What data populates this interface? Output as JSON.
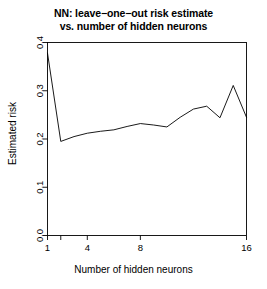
{
  "chart_data": {
    "type": "line",
    "title_line1": "NN: leave−one−out risk estimate",
    "title_line2": "vs. number of hidden neurons",
    "xlabel": "Number of hidden neurons",
    "ylabel": "Estimated risk",
    "x": [
      1,
      2,
      3,
      4,
      5,
      6,
      7,
      8,
      9,
      10,
      11,
      12,
      13,
      14,
      15,
      16
    ],
    "values": [
      0.378,
      0.195,
      0.205,
      0.212,
      0.216,
      0.219,
      0.226,
      0.232,
      0.229,
      0.225,
      0.245,
      0.262,
      0.268,
      0.244,
      0.311,
      0.245
    ],
    "series": [
      {
        "name": "Estimated risk",
        "values": [
          0.378,
          0.195,
          0.205,
          0.212,
          0.216,
          0.219,
          0.226,
          0.232,
          0.229,
          0.225,
          0.245,
          0.262,
          0.268,
          0.244,
          0.311,
          0.245
        ]
      }
    ],
    "xlim": [
      1,
      16
    ],
    "ylim": [
      0.0,
      0.4
    ],
    "xticks": [
      1,
      4,
      8,
      16
    ],
    "xticklabels": [
      "1",
      "4",
      "8",
      "16"
    ],
    "xticks_minor": [
      2
    ],
    "yticks": [
      0.0,
      0.1,
      0.2,
      0.3,
      0.4
    ],
    "yticklabels": [
      "0.0",
      "0.1",
      "0.2",
      "0.3",
      "0.4"
    ],
    "grid": false,
    "legend": "none",
    "line_color": "#000000",
    "background_color": "#ffffff",
    "frame": "box"
  }
}
